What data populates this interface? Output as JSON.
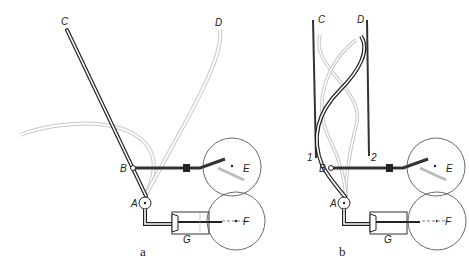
{
  "figure": {
    "panels": [
      {
        "id": "a",
        "caption": "a",
        "labels": {
          "C": "C",
          "D": "D",
          "B": "B",
          "A": "A",
          "E": "E",
          "F": "F",
          "G": "G"
        }
      },
      {
        "id": "b",
        "caption": "b",
        "labels": {
          "C": "C",
          "D": "D",
          "B": "B",
          "A": "A",
          "E": "E",
          "F": "F",
          "G": "G",
          "one": "1",
          "two": "2"
        }
      }
    ],
    "colors": {
      "ink": "#222222",
      "ghost": "#bbbbbb"
    }
  }
}
